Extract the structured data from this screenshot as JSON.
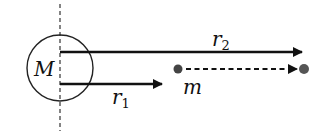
{
  "diagram": {
    "mass_label": "M",
    "small_mass_label": "m",
    "r1_label": "r",
    "r1_sub": "1",
    "r2_label": "r",
    "r2_sub": "2",
    "colors": {
      "line": "#111111",
      "dot": "#444444",
      "background": "#ffffff"
    }
  }
}
